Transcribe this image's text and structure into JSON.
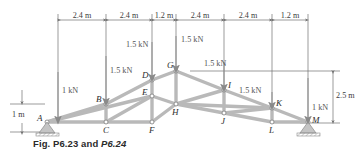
{
  "figure": {
    "caption_prefix": "Fig. P6.23 and ",
    "caption_italic": "P6.24",
    "caption_full": "Fig. P6.23 and P6.24"
  },
  "colors": {
    "member": "#b9b9b9",
    "member_edge": "#8f8f8f",
    "line": "#707070",
    "arrow": "#8a8a8a",
    "text": "#3d3d3d",
    "ground": "#a0a0a0",
    "background": "#ffffff"
  },
  "dimensions": {
    "horizontal_chain": [
      {
        "label": "2.4 m"
      },
      {
        "label": "2.4 m"
      },
      {
        "label": "1.2 m"
      },
      {
        "label": "2.4 m"
      },
      {
        "label": "2.4 m"
      },
      {
        "label": "1.2 m"
      }
    ],
    "vertical_right": {
      "label": "2.5 m"
    },
    "vertical_left": {
      "label": "1 m"
    }
  },
  "loads": [
    {
      "id": "load-A",
      "label": "1 kN",
      "node": "A"
    },
    {
      "id": "load-B",
      "label": "1.5 kN",
      "node": "B"
    },
    {
      "id": "load-D",
      "label": "1.5 kN",
      "node": "D"
    },
    {
      "id": "load-G",
      "label": "1.5 kN",
      "node": "G"
    },
    {
      "id": "load-I",
      "label": "1.5 kN",
      "node": "I"
    },
    {
      "id": "load-K",
      "label": "1.5 kN",
      "node": "K"
    },
    {
      "id": "load-M",
      "label": "1 kN",
      "node": "M"
    }
  ],
  "nodes": [
    {
      "id": "A",
      "label": "A"
    },
    {
      "id": "B",
      "label": "B"
    },
    {
      "id": "C",
      "label": "C"
    },
    {
      "id": "D",
      "label": "D"
    },
    {
      "id": "E",
      "label": "E"
    },
    {
      "id": "F",
      "label": "F"
    },
    {
      "id": "G",
      "label": "G"
    },
    {
      "id": "H",
      "label": "H"
    },
    {
      "id": "I",
      "label": "I"
    },
    {
      "id": "J",
      "label": "J"
    },
    {
      "id": "K",
      "label": "K"
    },
    {
      "id": "L",
      "label": "L"
    },
    {
      "id": "M",
      "label": "M"
    }
  ],
  "supports": [
    {
      "id": "support-A",
      "type": "pin",
      "node": "A"
    },
    {
      "id": "support-M",
      "type": "pin",
      "node": "M"
    }
  ]
}
